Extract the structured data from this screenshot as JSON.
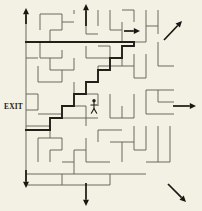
{
  "scene": {
    "title": "Maze puzzle with solution path",
    "background_color": "#f2f1e4",
    "wall_color": "#6b6a5c",
    "path_color": "#221f1a",
    "width": 202,
    "height": 211
  },
  "labels": {
    "exit": "EXIT"
  },
  "player": {
    "name": "stick-figure",
    "x": 94,
    "y": 107
  },
  "maze": {
    "bounds": {
      "x": 26,
      "y": 10,
      "width": 148,
      "height": 175
    },
    "walls": [
      "M26,42 L146,42",
      "M26,10 L26,185",
      "M40,14 L40,30",
      "M40,14 L62,14",
      "M62,14 L62,30",
      "M50,30 L62,30",
      "M50,30 L50,42",
      "M62,22 L74,22",
      "M74,14 L74,10",
      "M86,10 L86,34",
      "M86,34 L98,34",
      "M98,10 L98,26",
      "M110,10 L110,30",
      "M110,30 L122,30",
      "M122,22 L122,42",
      "M122,10 L134,10",
      "M134,10 L134,22",
      "M146,10 L146,42",
      "M146,26 L158,26",
      "M158,10 L158,34",
      "M40,42 L40,58",
      "M40,58 L62,58",
      "M62,50 L62,58",
      "M50,58 L50,70",
      "M50,70 L74,70",
      "M74,58 L74,70",
      "M62,70 L62,82",
      "M38,66 L38,82",
      "M38,82 L62,82",
      "M86,46 L86,58",
      "M86,58 L110,58",
      "M98,46 L110,46",
      "M110,46 L110,58",
      "M98,66 L134,66",
      "M98,66 L98,78",
      "M122,54 L122,66",
      "M134,54 L134,78",
      "M134,78 L146,78",
      "M146,54 L146,78",
      "M158,42 L158,66",
      "M158,66 L174,66",
      "M146,90 L174,90",
      "M158,90 L158,102",
      "M146,90 L146,114",
      "M146,114 L174,114",
      "M74,82 L74,94",
      "M74,94 L98,94",
      "M98,94 L98,106",
      "M110,94 L110,118",
      "M110,118 L134,118",
      "M122,106 L122,118",
      "M134,94 L134,118",
      "M86,106 L86,126",
      "M62,106 L86,106",
      "M62,118 L98,118",
      "M38,114 L62,114",
      "M26,126 L50,126",
      "M50,126 L50,138",
      "M38,138 L38,162",
      "M38,138 L62,138",
      "M62,138 L62,150",
      "M50,150 L62,150",
      "M50,150 L50,162",
      "M62,162 L74,162",
      "M74,150 L74,174",
      "M74,150 L86,150",
      "M86,138 L86,162",
      "M86,162 L110,162",
      "M98,130 L122,130",
      "M98,130 L98,142",
      "M110,142 L134,142",
      "M122,142 L122,162",
      "M134,126 L134,150",
      "M134,150 L146,150",
      "M146,126 L146,150",
      "M146,162 L170,162",
      "M158,126 L158,162",
      "M26,174 L146,174",
      "M26,185 L110,185",
      "M170,126 L170,162",
      "M158,102 L174,102",
      "M26,58 L38,58",
      "M26,94 L38,94",
      "M26,110 L38,110",
      "M38,94 L38,110",
      "M110,174 L110,185",
      "M62,174 L62,185"
    ],
    "solution": "M26,130 L50,130 L50,118 L62,118 L62,106 L74,106 L74,94 L86,94 L86,82 L98,82 L98,70 L110,70 L110,58 L122,58 L122,46 L134,46 L134,42 L26,42"
  },
  "arrows": [
    {
      "name": "arrow-up-left",
      "direction": "up",
      "x1": 26,
      "y1": 24,
      "x2": 26,
      "y2": 8
    },
    {
      "name": "arrow-up-top",
      "direction": "up",
      "x1": 86,
      "y1": 26,
      "x2": 86,
      "y2": 4
    },
    {
      "name": "arrow-right-top",
      "direction": "right",
      "x1": 124,
      "y1": 31,
      "x2": 140,
      "y2": 31
    },
    {
      "name": "arrow-up-right-diagonal",
      "direction": "up-right",
      "x1": 164,
      "y1": 40,
      "x2": 182,
      "y2": 21
    },
    {
      "name": "arrow-right-mid",
      "direction": "right",
      "x1": 173,
      "y1": 106,
      "x2": 196,
      "y2": 106
    },
    {
      "name": "arrow-down-left",
      "direction": "down",
      "x1": 26,
      "y1": 170,
      "x2": 26,
      "y2": 188
    },
    {
      "name": "arrow-down-bottom",
      "direction": "down",
      "x1": 86,
      "y1": 183,
      "x2": 86,
      "y2": 206
    },
    {
      "name": "arrow-down-right-diagonal",
      "direction": "down-right",
      "x1": 168,
      "y1": 184,
      "x2": 186,
      "y2": 202
    }
  ]
}
